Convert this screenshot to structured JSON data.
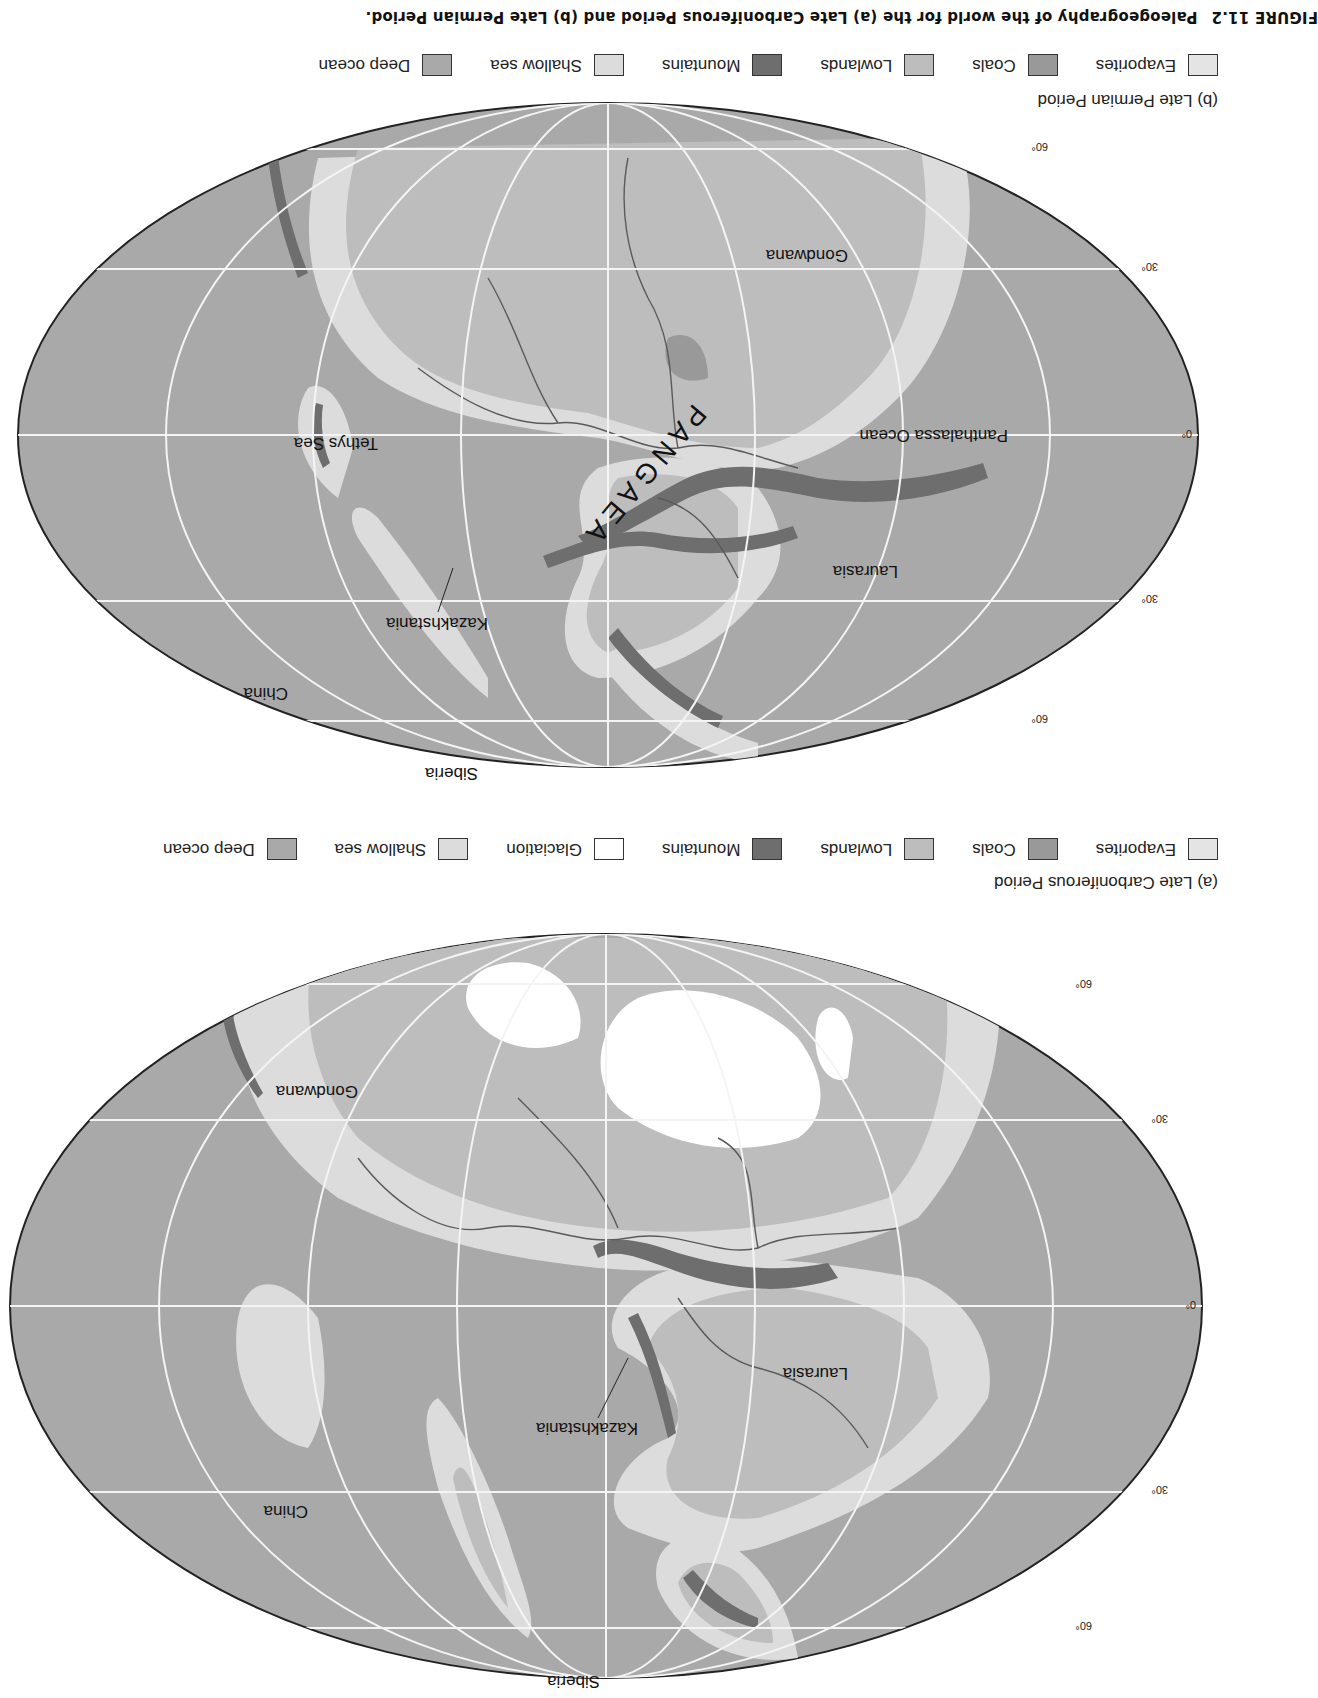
{
  "colors": {
    "deep_ocean": "#a9a9a9",
    "shallow_sea": "#dcdcdc",
    "glaciation": "#ffffff",
    "mountains": "#6e6e6e",
    "lowlands": "#bdbdbd",
    "coals": "#999999",
    "evaporites": "#e4e4e4",
    "grid": "#f4f4f4",
    "coastline": "#5a5a5a"
  },
  "caption": {
    "figure_number": "FIGURE 11.2",
    "text": "Paleogeography of the world for the (a) Late Carboniferous Period and (b) Late Permian Period."
  },
  "map_a": {
    "title": "(a) Late Carboniferous Period",
    "labels": {
      "siberia": "Siberia",
      "china": "China",
      "kazakhstania": "Kazakhstania",
      "laurasia": "Laurasia",
      "gondwana": "Gondwana"
    },
    "graticule_labels": {
      "lat_60n": "60°",
      "lat_30n": "30°",
      "lat_0": "0°",
      "lat_30s": "30°",
      "lat_60s": "60°"
    },
    "legend": [
      {
        "label": "Evaporites",
        "key": "evaporites"
      },
      {
        "label": "Coals",
        "key": "coals"
      },
      {
        "label": "Lowlands",
        "key": "lowlands"
      },
      {
        "label": "Mountains",
        "key": "mountains"
      },
      {
        "label": "Glaciation",
        "key": "glaciation"
      },
      {
        "label": "Shallow sea",
        "key": "shallow_sea"
      },
      {
        "label": "Deep ocean",
        "key": "deep_ocean"
      }
    ]
  },
  "map_b": {
    "title": "(b) Late Permian Period",
    "labels": {
      "siberia": "Siberia",
      "china": "China",
      "kazakhstania": "Kazakhstania",
      "laurasia": "Laurasia",
      "gondwana": "Gondwana",
      "tethys_sea": "Tethys Sea",
      "panthalassa_ocean": "Panthalassa Ocean",
      "pangaea": "PANGAEA"
    },
    "graticule_labels": {
      "lat_60n": "60°",
      "lat_30n": "30°",
      "lat_0": "0°",
      "lat_30s": "30°",
      "lat_60s": "60°"
    },
    "legend": [
      {
        "label": "Evaporites",
        "key": "evaporites"
      },
      {
        "label": "Coals",
        "key": "coals"
      },
      {
        "label": "Lowlands",
        "key": "lowlands"
      },
      {
        "label": "Mountains",
        "key": "mountains"
      },
      {
        "label": "Shallow sea",
        "key": "shallow_sea"
      },
      {
        "label": "Deep ocean",
        "key": "deep_ocean"
      }
    ]
  }
}
